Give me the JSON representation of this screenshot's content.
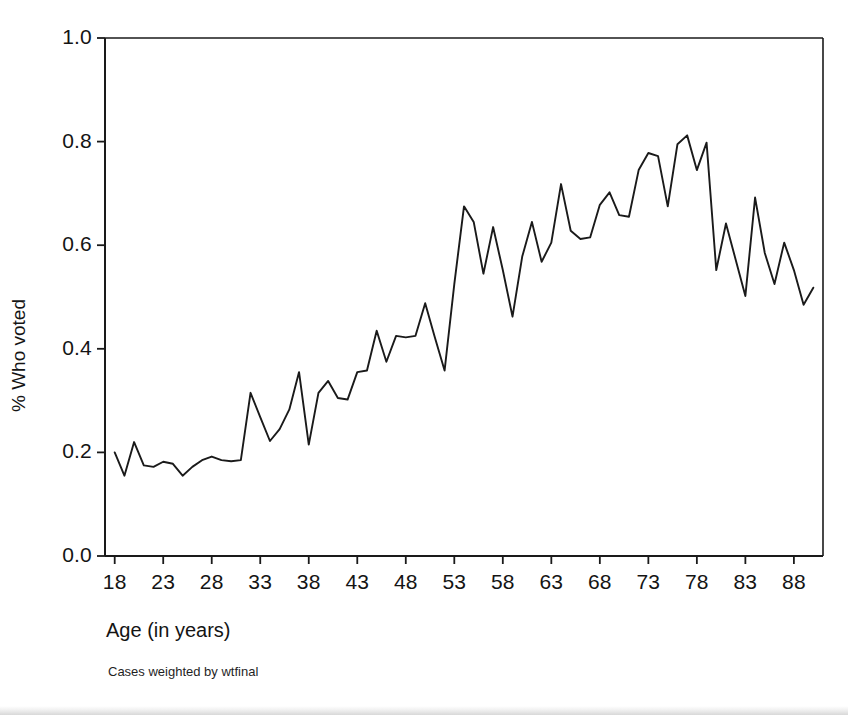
{
  "figure": {
    "background_color": "#ffffff",
    "line_color": "#1a1a1a",
    "axis_color": "#1a1a1a"
  },
  "axis_titles": {
    "x": "Age (in years)",
    "y": "% Who voted"
  },
  "footnote": "Cases weighted by wtfinal",
  "chart_data": {
    "type": "line",
    "title": "",
    "subtitle": "",
    "xlabel": "Age (in years)",
    "ylabel": "% Who voted",
    "xlim": [
      17,
      91
    ],
    "ylim": [
      0.0,
      1.0
    ],
    "grid": false,
    "legend": false,
    "legend_position": "none",
    "xticks": [
      18,
      23,
      28,
      33,
      38,
      43,
      48,
      53,
      58,
      63,
      68,
      73,
      78,
      83,
      88
    ],
    "xtick_labels": [
      "18",
      "23",
      "28",
      "33",
      "38",
      "43",
      "48",
      "53",
      "58",
      "63",
      "68",
      "73",
      "78",
      "83",
      "88"
    ],
    "yticks": [
      0.0,
      0.2,
      0.4,
      0.6,
      0.8,
      1.0
    ],
    "ytick_labels": [
      "0.0",
      "0.2",
      "0.4",
      "0.6",
      "0.8",
      "1.0"
    ],
    "series": [
      {
        "name": "% Who voted",
        "x": [
          18,
          19,
          20,
          21,
          22,
          23,
          24,
          25,
          26,
          27,
          28,
          29,
          30,
          31,
          32,
          33,
          34,
          35,
          36,
          37,
          38,
          39,
          40,
          41,
          42,
          43,
          44,
          45,
          46,
          47,
          48,
          49,
          50,
          51,
          52,
          53,
          54,
          55,
          56,
          57,
          58,
          59,
          60,
          61,
          62,
          63,
          64,
          65,
          66,
          67,
          68,
          69,
          70,
          71,
          72,
          73,
          74,
          75,
          76,
          77,
          78,
          79,
          80,
          81,
          82,
          83,
          84,
          85,
          86,
          87,
          88,
          89,
          90
        ],
        "values": [
          0.2,
          0.155,
          0.22,
          0.175,
          0.172,
          0.182,
          0.178,
          0.155,
          0.172,
          0.185,
          0.192,
          0.185,
          0.183,
          0.185,
          0.315,
          0.268,
          0.222,
          0.245,
          0.283,
          0.355,
          0.215,
          0.315,
          0.338,
          0.305,
          0.302,
          0.355,
          0.358,
          0.435,
          0.375,
          0.425,
          0.422,
          0.425,
          0.488,
          0.422,
          0.358,
          0.525,
          0.675,
          0.645,
          0.545,
          0.635,
          0.552,
          0.462,
          0.578,
          0.645,
          0.568,
          0.605,
          0.718,
          0.628,
          0.612,
          0.615,
          0.678,
          0.702,
          0.658,
          0.655,
          0.745,
          0.778,
          0.772,
          0.675,
          0.795,
          0.812,
          0.745,
          0.798,
          0.552,
          0.642,
          0.572,
          0.502,
          0.692,
          0.585,
          0.525,
          0.605,
          0.552,
          0.485,
          0.518
        ]
      }
    ]
  }
}
